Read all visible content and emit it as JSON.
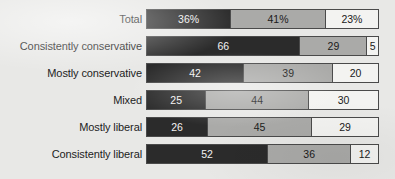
{
  "chart_data": {
    "type": "bar",
    "orientation": "horizontal",
    "stacked": true,
    "normalized_percent": true,
    "title": "",
    "subtitle": "",
    "xlabel": "",
    "ylabel": "",
    "xlim": [
      0,
      100
    ],
    "grid": false,
    "legend_position": "none",
    "categories": [
      "Total",
      "Consistently conservative",
      "Mostly conservative",
      "Mixed",
      "Mostly liberal",
      "Consistently liberal"
    ],
    "series": [
      {
        "name": "segment-1",
        "color": "#2b2b2b",
        "values": [
          36,
          66,
          42,
          25,
          26,
          52
        ]
      },
      {
        "name": "segment-2",
        "color": "#aaaaa8",
        "values": [
          41,
          29,
          39,
          44,
          45,
          36
        ]
      },
      {
        "name": "segment-3",
        "color": "#f3f3f1",
        "values": [
          23,
          5,
          20,
          30,
          29,
          12
        ]
      }
    ],
    "rows": [
      {
        "label": "Total",
        "segments": [
          {
            "value": 36,
            "text": "36%",
            "tone": "dark"
          },
          {
            "value": 41,
            "text": "41%",
            "tone": "mid"
          },
          {
            "value": 23,
            "text": "23%",
            "tone": "light"
          }
        ]
      },
      {
        "label": "Consistently conservative",
        "segments": [
          {
            "value": 66,
            "text": "66",
            "tone": "dark"
          },
          {
            "value": 29,
            "text": "29",
            "tone": "mid"
          },
          {
            "value": 5,
            "text": "5",
            "tone": "light"
          }
        ]
      },
      {
        "label": "Mostly conservative",
        "segments": [
          {
            "value": 42,
            "text": "42",
            "tone": "dark"
          },
          {
            "value": 39,
            "text": "39",
            "tone": "mid"
          },
          {
            "value": 20,
            "text": "20",
            "tone": "light"
          }
        ]
      },
      {
        "label": "Mixed",
        "segments": [
          {
            "value": 25,
            "text": "25",
            "tone": "dark"
          },
          {
            "value": 44,
            "text": "44",
            "tone": "mid"
          },
          {
            "value": 30,
            "text": "30",
            "tone": "light"
          }
        ]
      },
      {
        "label": "Mostly liberal",
        "segments": [
          {
            "value": 26,
            "text": "26",
            "tone": "dark"
          },
          {
            "value": 45,
            "text": "45",
            "tone": "mid"
          },
          {
            "value": 29,
            "text": "29",
            "tone": "light"
          }
        ]
      },
      {
        "label": "Consistently liberal",
        "segments": [
          {
            "value": 52,
            "text": "52",
            "tone": "dark"
          },
          {
            "value": 36,
            "text": "36",
            "tone": "mid"
          },
          {
            "value": 12,
            "text": "12",
            "tone": "light"
          }
        ]
      }
    ]
  },
  "style": {
    "background_color": "#e8e8e6",
    "segment_dark_color": "#2b2b2b",
    "segment_mid_color": "#aaaaa8",
    "segment_light_color": "#f3f3f1",
    "bar_border_color": "#4a4a4a",
    "label_text_color": "#1d1d1d"
  },
  "layout": {
    "bar_left_px": 146,
    "bar_width_px": 233,
    "bar_height_px": 20,
    "row_pitch_px": 27,
    "first_row_top_px": 9
  }
}
